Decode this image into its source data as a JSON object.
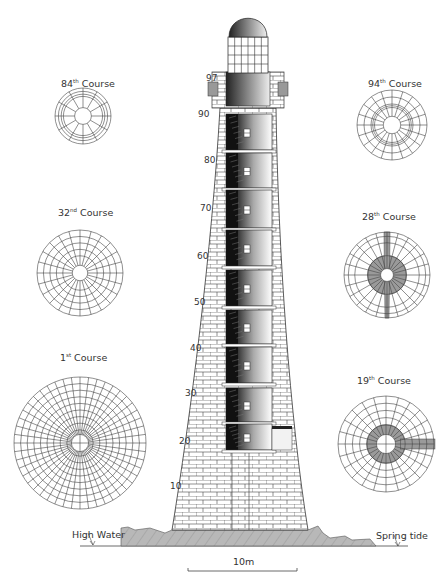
{
  "figure": {
    "courses": [
      {
        "id": "course-84",
        "number": "84",
        "suffix": "th",
        "label": "Course",
        "cx": 83,
        "cy": 116,
        "r": 28,
        "style": "inner-ring"
      },
      {
        "id": "course-32",
        "number": "32",
        "suffix": "nd",
        "label": "Course",
        "cx": 80,
        "cy": 273,
        "r": 43,
        "style": "multi-ring"
      },
      {
        "id": "course-1",
        "number": "1",
        "suffix": "st",
        "label": "Course",
        "cx": 80,
        "cy": 443,
        "r": 66,
        "style": "dense"
      },
      {
        "id": "course-94",
        "number": "94",
        "suffix": "th",
        "label": "Course",
        "cx": 392,
        "cy": 125,
        "r": 35,
        "style": "outer-ring"
      },
      {
        "id": "course-28",
        "number": "28",
        "suffix": "th",
        "label": "Course",
        "cx": 387,
        "cy": 275,
        "r": 43,
        "style": "shaded-cross"
      },
      {
        "id": "course-19",
        "number": "19",
        "suffix": "th",
        "label": "Course",
        "cx": 386,
        "cy": 444,
        "r": 48,
        "style": "shaded-ring"
      }
    ],
    "course_label_positions": [
      {
        "x": 61,
        "y": 79
      },
      {
        "x": 58,
        "y": 208
      },
      {
        "x": 60,
        "y": 353
      },
      {
        "x": 368,
        "y": 79
      },
      {
        "x": 362,
        "y": 212
      },
      {
        "x": 357,
        "y": 376
      }
    ],
    "height_ticks": [
      {
        "value": "97",
        "x": 206,
        "y": 74
      },
      {
        "value": "90",
        "x": 198,
        "y": 110
      },
      {
        "value": "80",
        "x": 204,
        "y": 156
      },
      {
        "value": "70",
        "x": 200,
        "y": 204
      },
      {
        "value": "60",
        "x": 197,
        "y": 252
      },
      {
        "value": "50",
        "x": 194,
        "y": 298
      },
      {
        "value": "40",
        "x": 190,
        "y": 344
      },
      {
        "value": "30",
        "x": 185,
        "y": 389
      },
      {
        "value": "20",
        "x": 179,
        "y": 437
      },
      {
        "value": "10",
        "x": 170,
        "y": 482
      }
    ],
    "water_labels": {
      "high_water": "High Water",
      "spring_tide": "Spring tide"
    },
    "scale_bar": {
      "label": "10m"
    },
    "colors": {
      "line": "#333333",
      "rock": "#b5b5b5",
      "shade": "#9a9a9a",
      "dark": "#1a1a1a"
    }
  }
}
